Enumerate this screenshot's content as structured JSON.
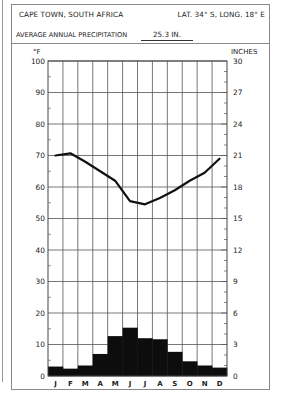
{
  "header": {
    "title": "CAPE TOWN, SOUTH AFRICA",
    "coordinates": "LAT. 34° S, LONG. 18° E",
    "precip_label": "AVERAGE ANNUAL PRECIPITATION",
    "precip_value": "25.3 IN."
  },
  "axes": {
    "left_unit": "°F",
    "right_unit": "INCHES"
  },
  "chart_data": {
    "type": "bar+line",
    "subtitle": "AVERAGE ANNUAL PRECIPITATION 25.3 IN.",
    "categories": [
      "J",
      "F",
      "M",
      "A",
      "M",
      "J",
      "J",
      "A",
      "S",
      "O",
      "N",
      "D"
    ],
    "series": [
      {
        "name": "Temperature (°F)",
        "type": "line",
        "axis": "left",
        "values": [
          70,
          70.7,
          68,
          65,
          62,
          55.5,
          54.5,
          56.5,
          59,
          62,
          64.5,
          69
        ]
      },
      {
        "name": "Precipitation (inches)",
        "type": "bar",
        "axis": "right",
        "values": [
          0.9,
          0.7,
          1.0,
          2.1,
          3.8,
          4.6,
          3.6,
          3.5,
          2.3,
          1.4,
          1.0,
          0.8
        ]
      }
    ],
    "xlabel": "",
    "ylabel_left": "°F",
    "ylabel_right": "INCHES",
    "ylim_left": [
      0,
      100
    ],
    "ylim_right": [
      0,
      30
    ],
    "left_ticks": [
      0,
      10,
      20,
      30,
      40,
      50,
      60,
      70,
      80,
      90,
      100
    ],
    "right_ticks": [
      0,
      3,
      6,
      9,
      12,
      15,
      18,
      21,
      24,
      27,
      30
    ],
    "grid": true,
    "legend": "none"
  }
}
